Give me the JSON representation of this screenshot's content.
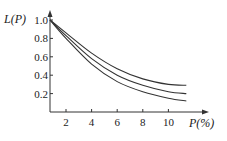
{
  "chart_data": {
    "type": "line",
    "title": "",
    "xlabel": "P(%)",
    "ylabel": "L(P)",
    "xlim": [
      0.75,
      12
    ],
    "ylim": [
      0,
      1.0
    ],
    "xticks": [
      2,
      4,
      6,
      8,
      10
    ],
    "yticks": [
      0.2,
      0.4,
      0.6,
      0.8,
      1.0
    ],
    "xtick_labels": [
      "2",
      "4",
      "6",
      "8",
      "10"
    ],
    "ytick_labels": [
      "0.2",
      "0.4",
      "0.6",
      "0.8",
      "1.0"
    ],
    "grid": false,
    "legend": null,
    "x": [
      0.75,
      2,
      4,
      6,
      8,
      10,
      11.4
    ],
    "series": [
      {
        "name": "curve-upper",
        "values": [
          1.0,
          0.86,
          0.64,
          0.47,
          0.36,
          0.3,
          0.29
        ]
      },
      {
        "name": "curve-middle",
        "values": [
          1.0,
          0.83,
          0.58,
          0.4,
          0.29,
          0.22,
          0.2
        ]
      },
      {
        "name": "curve-lower",
        "values": [
          1.0,
          0.8,
          0.52,
          0.33,
          0.22,
          0.15,
          0.12
        ]
      }
    ],
    "color": "#333333"
  }
}
